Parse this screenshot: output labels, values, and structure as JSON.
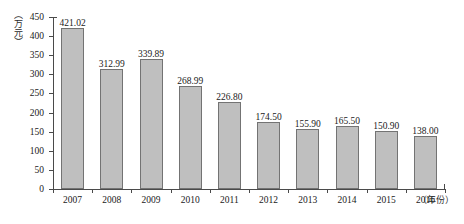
{
  "chart_data": {
    "type": "bar",
    "title": "",
    "subtitle": "",
    "xlabel": "（年份）",
    "ylabel": "（万元）",
    "categories": [
      "2007",
      "2008",
      "2009",
      "2010",
      "2011",
      "2012",
      "2013",
      "2014",
      "2015",
      "2016"
    ],
    "values": [
      421.02,
      312.99,
      339.89,
      268.99,
      226.8,
      174.5,
      155.9,
      165.5,
      150.9,
      138.0
    ],
    "value_labels": [
      "421.02",
      "312.99",
      "339.89",
      "268.99",
      "226.80",
      "174.50",
      "155.90",
      "165.50",
      "150.90",
      "138.00"
    ],
    "ylim": [
      0,
      450
    ],
    "ytick_values": [
      0,
      50,
      100,
      150,
      200,
      250,
      300,
      350,
      400,
      450
    ],
    "ytick_labels": [
      "0",
      "50",
      "100",
      "150",
      "200",
      "250",
      "300",
      "350",
      "400",
      "450"
    ],
    "grid": false,
    "legend": null,
    "legend_position": "none",
    "bar_color": "#bfbfbf",
    "bar_border_color": "#737373",
    "axis_color": "#4a4a4a",
    "text_color": "#1a1a1a"
  }
}
